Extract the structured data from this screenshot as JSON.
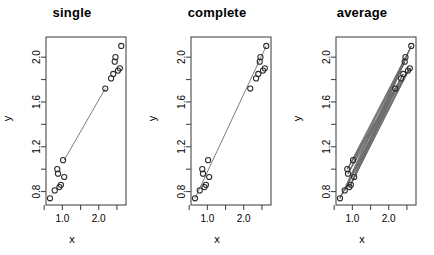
{
  "figure": {
    "clipped_header_text": "",
    "background_color": "#ffffff",
    "foreground_color": "#000000",
    "line_color": "#6e6e6e",
    "point_color": "#2b2b2b"
  },
  "panels": [
    {
      "id": "single",
      "title": "single",
      "xlabel": "x",
      "ylabel": "y",
      "linkage": "single"
    },
    {
      "id": "complete",
      "title": "complete",
      "xlabel": "x",
      "ylabel": "y",
      "linkage": "complete"
    },
    {
      "id": "average",
      "title": "average",
      "xlabel": "x",
      "ylabel": "y",
      "linkage": "average"
    }
  ],
  "chart_data": {
    "type": "scatter",
    "title": "",
    "n_panels": 3,
    "panel_titles": [
      "single",
      "complete",
      "average"
    ],
    "xlabel": "x",
    "ylabel": "y",
    "xlim": [
      0.55,
      2.75
    ],
    "ylim": [
      0.68,
      2.18
    ],
    "xticks": [
      0.5,
      1.0,
      1.5,
      2.0,
      2.5
    ],
    "xtick_labels": [
      "",
      "1.0",
      "",
      "2.0",
      ""
    ],
    "yticks": [
      0.8,
      1.0,
      1.2,
      1.4,
      1.6,
      1.8,
      2.0
    ],
    "ytick_labels": [
      "0.8",
      "",
      "1.2",
      "",
      "1.6",
      "",
      "2.0"
    ],
    "grid": false,
    "legend": null,
    "point_symbol": "open-circle",
    "cluster_a": {
      "name": "low-cluster",
      "x": [
        0.66,
        0.79,
        0.86,
        0.88,
        0.92,
        0.96,
        1.02,
        1.05
      ],
      "y": [
        0.74,
        0.81,
        1.0,
        0.96,
        0.84,
        0.86,
        1.08,
        0.93
      ]
    },
    "cluster_b": {
      "name": "high-cluster",
      "x": [
        2.18,
        2.34,
        2.4,
        2.44,
        2.46,
        2.53,
        2.58,
        2.62
      ],
      "y": [
        1.72,
        1.81,
        1.85,
        1.96,
        2.0,
        1.88,
        1.9,
        2.1
      ]
    },
    "linkage_lines": {
      "single": [
        {
          "x1": 1.05,
          "y1": 1.08,
          "x2": 2.18,
          "y2": 1.72
        }
      ],
      "complete": [
        {
          "x1": 0.66,
          "y1": 0.74,
          "x2": 2.62,
          "y2": 2.1
        }
      ],
      "average": "all-pairs"
    },
    "annotations": []
  }
}
